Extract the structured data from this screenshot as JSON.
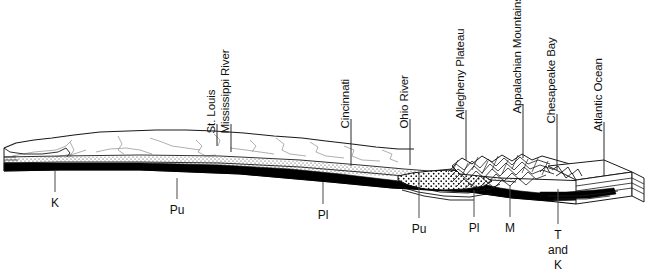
{
  "figure": {
    "kind": "geologic-block-diagram",
    "orientation": "west-to-east transect",
    "background_color": "#ffffff",
    "ink_color": "#101010"
  },
  "surface_labels": [
    {
      "text": "St. Louis",
      "x": 217,
      "label_bottom_y": 122,
      "leader_top_y": 124,
      "leader_bottom_y": 146
    },
    {
      "text": "Mississippi River",
      "x": 231,
      "label_bottom_y": 122,
      "leader_top_y": 124,
      "leader_bottom_y": 152
    },
    {
      "text": "Cincinnati",
      "x": 351,
      "label_bottom_y": 117,
      "leader_top_y": 119,
      "leader_bottom_y": 166
    },
    {
      "text": "Ohio River",
      "x": 410,
      "label_bottom_y": 117,
      "leader_top_y": 119,
      "leader_bottom_y": 165
    },
    {
      "text": "Allegheny Plateau",
      "x": 466,
      "label_bottom_y": 108,
      "leader_top_y": 110,
      "leader_bottom_y": 160
    },
    {
      "text": "Appalachian Mountains",
      "x": 523,
      "label_bottom_y": 102,
      "leader_top_y": 104,
      "leader_bottom_y": 158
    },
    {
      "text": "Chesapeake Bay",
      "x": 557,
      "label_bottom_y": 112,
      "leader_top_y": 114,
      "leader_bottom_y": 170
    },
    {
      "text": "Atlantic Ocean",
      "x": 604,
      "label_bottom_y": 120,
      "leader_top_y": 122,
      "leader_bottom_y": 176
    }
  ],
  "unit_labels": [
    {
      "text": "K",
      "x": 55,
      "text_y": 196,
      "leader_top_y": 171,
      "leader_bottom_y": 192
    },
    {
      "text": "Pu",
      "x": 177,
      "text_y": 203,
      "leader_top_y": 178,
      "leader_bottom_y": 199
    },
    {
      "text": "Pl",
      "x": 323,
      "text_y": 208,
      "leader_top_y": 182,
      "leader_bottom_y": 204
    },
    {
      "text": "Pu",
      "x": 419,
      "text_y": 222,
      "leader_top_y": 173,
      "leader_bottom_y": 218
    },
    {
      "text": "Pl",
      "x": 474,
      "text_y": 221,
      "leader_top_y": 190,
      "leader_bottom_y": 217
    },
    {
      "text": "M",
      "x": 510,
      "text_y": 221,
      "leader_top_y": 186,
      "leader_bottom_y": 217
    },
    {
      "text": "T\nand\nK",
      "x": 558,
      "text_y": 228,
      "leader_top_y": 189,
      "leader_bottom_y": 224,
      "stacked": true
    }
  ]
}
